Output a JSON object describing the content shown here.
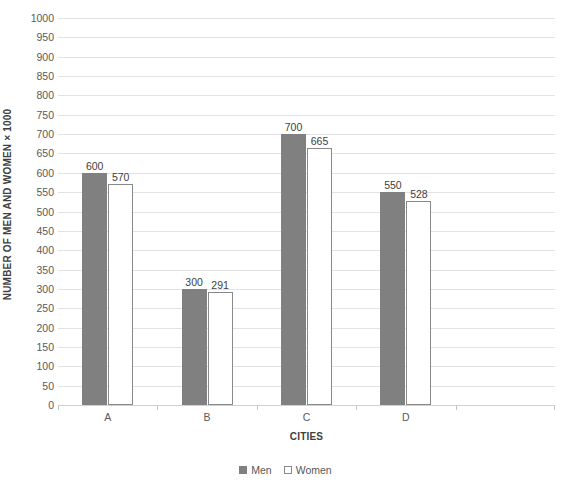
{
  "chart_data": {
    "type": "bar",
    "title": "",
    "categories": [
      "A",
      "B",
      "C",
      "D",
      ""
    ],
    "series": [
      {
        "name": "Men",
        "values": [
          600,
          300,
          700,
          550,
          null
        ],
        "color": "#808080",
        "fill": "solid"
      },
      {
        "name": "Women",
        "values": [
          570,
          291,
          665,
          528,
          null
        ],
        "color": "#ffffff",
        "fill": "outline"
      }
    ],
    "xlabel": "CITIES",
    "ylabel": "NUMBER OF MEN AND WOMEN × 1000",
    "ylim": [
      0,
      1000
    ],
    "ytick_step": 50,
    "yticks": [
      0,
      50,
      100,
      150,
      200,
      250,
      300,
      350,
      400,
      450,
      500,
      550,
      600,
      650,
      700,
      750,
      800,
      850,
      900,
      950,
      1000
    ],
    "ytick_labels": [
      "0",
      "50",
      "100",
      "150",
      "200",
      "250",
      "300",
      "350",
      "400",
      "450",
      "500",
      "550",
      "600",
      "650",
      "700",
      "750",
      "800",
      "850",
      "900",
      "950",
      "1000"
    ],
    "data_labels": {
      "Men": [
        "600",
        "300",
        "700",
        "550"
      ],
      "Women": [
        "570",
        "291",
        "665",
        "528"
      ]
    },
    "grid": {
      "horizontal": true,
      "vertical": false,
      "color": "#e2e2e2"
    },
    "legend": {
      "position": "bottom",
      "entries": [
        "Men",
        "Women"
      ]
    },
    "gridline_color": "#e2e2e2",
    "axis_color": "#d0d0d0",
    "tick_label_color": "#595959",
    "axis_title_color": "#404040",
    "data_label_color": "#404040",
    "background": "#ffffff"
  }
}
